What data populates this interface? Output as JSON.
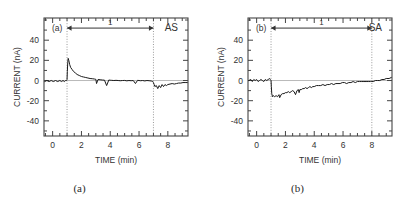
{
  "figure": {
    "caption_a": "(a)",
    "caption_b": "(b)"
  },
  "chart_data": [
    {
      "type": "line",
      "panel_label": "(a)",
      "condition_label": "AS",
      "title": "",
      "xlabel": "TIME  (min)",
      "ylabel": "CURRENT  (nA)",
      "xlim": [
        -0.6,
        9.4
      ],
      "ylim": [
        -55,
        62
      ],
      "xticks": [
        0,
        2,
        4,
        6,
        8
      ],
      "yticks": [
        -40,
        -20,
        0,
        20,
        40
      ],
      "grid": false,
      "legend": "none",
      "zero_line": 0,
      "annotations": {
        "span_arrow_label": "1",
        "span_start": 1,
        "span_end": 7,
        "span_arrow_y": 52,
        "marker_lines": [
          1,
          7
        ]
      },
      "x": [
        -0.55,
        -0.4,
        -0.25,
        -0.1,
        0.05,
        0.2,
        0.35,
        0.5,
        0.62,
        0.72,
        0.82,
        0.9,
        0.96,
        1.0,
        1.02,
        1.05,
        1.08,
        1.12,
        1.18,
        1.25,
        1.35,
        1.45,
        1.58,
        1.7,
        1.85,
        2.0,
        2.15,
        2.3,
        2.45,
        2.6,
        2.75,
        2.9,
        3.0,
        3.05,
        3.15,
        3.3,
        3.45,
        3.6,
        3.75,
        3.9,
        4.0,
        4.1,
        4.25,
        4.4,
        4.55,
        4.7,
        4.85,
        5.0,
        5.15,
        5.3,
        5.45,
        5.6,
        5.75,
        5.9,
        6.0,
        6.1,
        6.25,
        6.4,
        6.55,
        6.7,
        6.85,
        6.95,
        7.0,
        7.05,
        7.1,
        7.2,
        7.3,
        7.4,
        7.5,
        7.6,
        7.7,
        7.8,
        7.9,
        8.0,
        8.15,
        8.3,
        8.45,
        8.6,
        8.75,
        8.9,
        9.05,
        9.2,
        9.35
      ],
      "y": [
        -1,
        0,
        -1,
        0,
        -1,
        0,
        -1,
        0,
        -1,
        0,
        -1,
        0,
        0,
        1,
        9,
        18,
        22,
        20,
        16,
        13,
        11,
        9,
        7.5,
        6,
        5,
        4,
        3.5,
        3,
        2.5,
        2,
        1.8,
        1.5,
        1.2,
        -3,
        1,
        0.8,
        0.5,
        0.4,
        -5,
        0.5,
        0.3,
        0.2,
        0,
        0.2,
        0,
        -0.2,
        0,
        0.1,
        -0.3,
        0,
        -0.2,
        0,
        -3,
        0.2,
        0,
        -0.2,
        0,
        -0.4,
        0,
        -0.2,
        -0.5,
        -1,
        -2,
        -4,
        -6,
        -5,
        -8,
        -5,
        -7,
        -4,
        -6,
        -4,
        -5,
        -4,
        -3.5,
        -3,
        -3.5,
        -3,
        -2.5,
        -2.5,
        -2,
        -2,
        -2
      ]
    },
    {
      "type": "line",
      "panel_label": "(b)",
      "condition_label": "SA",
      "title": "",
      "xlabel": "TIME  (min)",
      "ylabel": "CURRENT  (nA)",
      "xlim": [
        -0.6,
        9.4
      ],
      "ylim": [
        -55,
        62
      ],
      "xticks": [
        0,
        2,
        4,
        6,
        8
      ],
      "yticks": [
        -40,
        -20,
        0,
        20,
        40
      ],
      "grid": false,
      "legend": "none",
      "zero_line": 0,
      "annotations": {
        "span_arrow_label": "1",
        "span_start": 1,
        "span_end": 8,
        "span_arrow_y": 52,
        "marker_lines": [
          1,
          8
        ]
      },
      "x": [
        -0.55,
        -0.4,
        -0.3,
        -0.2,
        -0.1,
        0.0,
        0.1,
        0.2,
        0.3,
        0.4,
        0.5,
        0.6,
        0.7,
        0.8,
        0.9,
        0.95,
        1.0,
        1.02,
        1.05,
        1.1,
        1.15,
        1.25,
        1.35,
        1.45,
        1.55,
        1.6,
        1.7,
        1.8,
        1.9,
        2.0,
        2.1,
        2.2,
        2.3,
        2.4,
        2.5,
        2.6,
        2.7,
        2.8,
        2.9,
        2.95,
        3.0,
        3.1,
        3.2,
        3.3,
        3.4,
        3.5,
        3.6,
        3.7,
        3.8,
        3.9,
        4.0,
        4.15,
        4.3,
        4.45,
        4.6,
        4.75,
        4.9,
        5.05,
        5.2,
        5.35,
        5.5,
        5.65,
        5.8,
        5.95,
        6.1,
        6.25,
        6.4,
        6.55,
        6.7,
        6.85,
        7.0,
        7.15,
        7.3,
        7.45,
        7.6,
        7.75,
        7.9,
        8.0,
        8.1,
        8.25,
        8.4,
        8.55,
        8.7,
        8.85,
        9.0,
        9.2,
        9.35
      ],
      "y": [
        0,
        1,
        -1,
        1,
        0,
        1,
        -1,
        0,
        1,
        0,
        -1,
        1,
        0,
        1,
        2,
        1,
        0,
        -6,
        -13,
        -16,
        -15,
        -16,
        -15,
        -16,
        -14,
        -17,
        -14,
        -13,
        -13,
        -12,
        -12,
        -11,
        -12,
        -11,
        -10,
        -11,
        -14,
        -10,
        -9,
        -12,
        -9,
        -9,
        -8,
        -8,
        -7,
        -8,
        -7,
        -6,
        -7,
        -6,
        -6,
        -5,
        -5,
        -5,
        -4,
        -5,
        -4,
        -4,
        -3,
        -4,
        -3,
        -3,
        -3,
        -2,
        -2,
        -3,
        -2,
        -2,
        -1,
        -2,
        -1,
        -1,
        -1,
        -1,
        -1,
        -1,
        -1,
        -1,
        -1,
        0,
        0,
        0,
        1,
        1,
        2,
        2,
        3
      ]
    }
  ]
}
